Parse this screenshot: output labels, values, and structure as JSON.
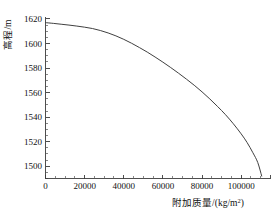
{
  "chart_data": {
    "type": "line",
    "title": "",
    "subtitle": "",
    "xlabel": "附加质量/(kg/m",
    "xlabel_sup": "2",
    "xlabel_tail": ")",
    "ylabel": "高程/m",
    "xlim": [
      0,
      115000
    ],
    "ylim": [
      1490,
      1622
    ],
    "grid": false,
    "legend": null,
    "legend_position": "none",
    "line_color": "#404040",
    "axis_color": "#3b3b3b",
    "background_color": "#ffffff",
    "x_ticks": [
      0,
      20000,
      40000,
      60000,
      80000,
      100000
    ],
    "x_tick_labels": [
      "0",
      "20000",
      "40000",
      "60000",
      "80000",
      "100000"
    ],
    "x_minor_step": 5000,
    "y_ticks": [
      1500,
      1520,
      1540,
      1560,
      1580,
      1600,
      1620
    ],
    "y_tick_labels": [
      "1500",
      "1520",
      "1540",
      "1560",
      "1580",
      "1600",
      "1620"
    ],
    "y_minor_step": 5,
    "series": [
      {
        "name": "高程-附加质量曲线",
        "x": [
          0,
          4000,
          8000,
          12000,
          16000,
          20000,
          24000,
          28000,
          32000,
          36000,
          40000,
          44000,
          48000,
          52000,
          56000,
          60000,
          64000,
          68000,
          72000,
          76000,
          80000,
          84000,
          88000,
          92000,
          96000,
          100000,
          103000,
          106000,
          108500,
          110500
        ],
        "y": [
          1617.0,
          1616.4,
          1615.7,
          1615.0,
          1614.2,
          1613.3,
          1612.2,
          1610.6,
          1608.6,
          1606.2,
          1603.4,
          1600.2,
          1596.7,
          1593.0,
          1589.0,
          1584.8,
          1580.4,
          1575.8,
          1571.0,
          1566.0,
          1560.6,
          1554.8,
          1548.6,
          1542.0,
          1534.6,
          1526.4,
          1519.4,
          1511.0,
          1503.0,
          1492.0
        ]
      }
    ]
  }
}
